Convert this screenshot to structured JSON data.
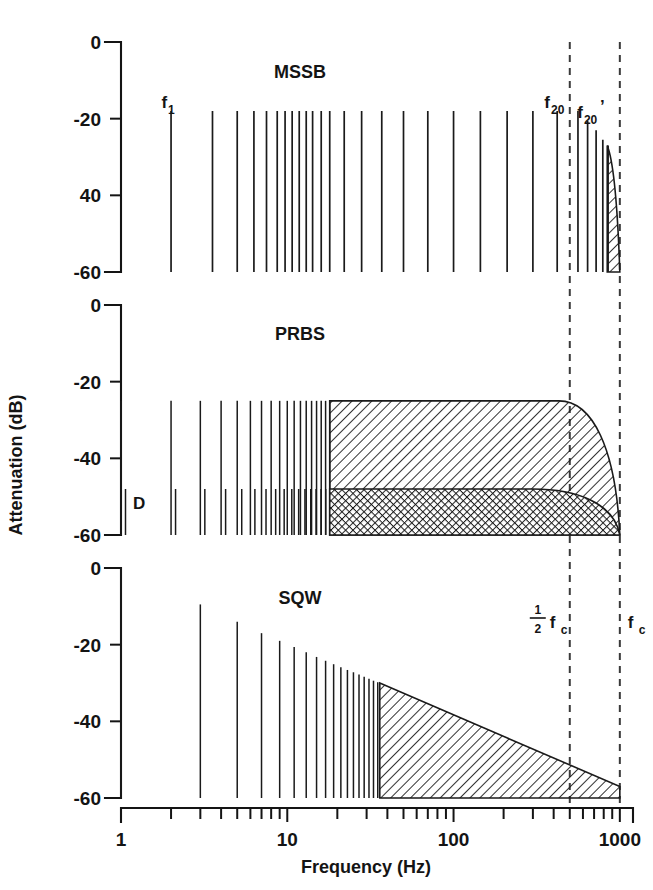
{
  "figure": {
    "axis_titles": {
      "x": "Frequency (Hz)",
      "y": "Attenuation (dB)"
    },
    "x_axis": {
      "scale": "log",
      "min": 1,
      "max": 1200,
      "tick_labels": [
        "1",
        "10",
        "100",
        "1000"
      ],
      "tick_values": [
        1,
        10,
        100,
        1000
      ]
    },
    "y_axis": {
      "min": -60,
      "max": 0,
      "tick_values": [
        0,
        -20,
        -40,
        -60
      ],
      "panel_tick_labels": {
        "mssb": [
          "0",
          "-20",
          "40",
          "-60"
        ],
        "prbs": [
          "0",
          "-20",
          "-40",
          "-60"
        ],
        "sqw": [
          "0",
          "-20",
          "-40",
          "-60"
        ]
      }
    },
    "annotations": {
      "f1": "f",
      "f1_sub": "1",
      "f20": "f",
      "f20_sub": "20",
      "f20p": "f",
      "f20p_sub": "20",
      "f20p_prime": "’",
      "half_fc_num": "1",
      "half_fc_den": "2",
      "half_fc_f": "f",
      "half_fc_sub": "c",
      "fc_f": "f",
      "fc_sub": "c",
      "prbs_D": "D"
    },
    "markers": {
      "half_fc_value": 500,
      "fc_value": 1000
    }
  },
  "chart_data": [
    {
      "type": "line",
      "title": "MSSB",
      "panel": "mssb",
      "xlabel": "Frequency (Hz)",
      "ylabel": "Attenuation (dB)",
      "xscale": "log",
      "xlim": [
        1,
        1200
      ],
      "ylim": [
        -60,
        0
      ],
      "grid": false,
      "legend": "none",
      "description": "Multi-sine stepped binary spectral lines: 20 harmonics at -18 dB plus aliased images above fc/2 and a hatched alias wedge near fc",
      "stems": {
        "x": [
          2.0,
          3.55,
          5.0,
          6.3,
          7.5,
          8.7,
          9.7,
          10.7,
          11.8,
          13.0,
          14.2,
          16.0,
          18.0,
          22.0,
          28.0,
          37.0,
          50.0,
          70.0,
          100.0,
          145.0,
          210.0,
          300.0,
          420.0
        ],
        "y_top": -18,
        "y_bottom": -60
      },
      "alias_stems": {
        "x": [
          560.0,
          640.0,
          720.0,
          790.0,
          850.0
        ],
        "y_top": [
          -18,
          -20.5,
          -23,
          -25.5,
          -27
        ],
        "y_bottom": -60
      },
      "alias_wedge": {
        "x_start": 840,
        "x_end": 1000,
        "y_top_start": -27,
        "y_top_end": -60,
        "y_bottom": -60,
        "fill": "diagonal-hatch"
      }
    },
    {
      "type": "line",
      "title": "PRBS",
      "panel": "prbs",
      "xlabel": "Frequency (Hz)",
      "ylabel": "Attenuation (dB)",
      "xscale": "log",
      "xlim": [
        1,
        1200
      ],
      "ylim": [
        -60,
        0
      ],
      "grid": false,
      "legend": "none",
      "description": "Pseudo random binary sequence: harmonic comb at -25 dB with a lower distortion comb D at -48 dB; both merge into continuous bands that roll off beyond fc/2",
      "stems_primary": {
        "x": [
          1.0,
          2.0,
          3.0,
          4.0,
          5.0,
          6.0,
          7.0,
          8.0,
          9.0,
          10.0,
          11.0,
          12.0,
          13.0,
          14.0,
          15.0,
          16.0,
          17.0,
          18.0
        ],
        "y_top": -25,
        "y_bottom": -60
      },
      "stems_distortion": {
        "x": [
          1.0,
          2.0,
          3.0,
          4.0,
          5.0,
          6.0,
          7.0,
          8.0,
          9.0,
          10.0,
          11.0,
          12.0,
          13.0,
          14.0,
          15.0,
          16.0,
          17.0,
          18.0
        ],
        "y_top": -48,
        "y_bottom": -60,
        "label": "D"
      },
      "band_primary": {
        "x_start": 18,
        "y_level": -25,
        "rolloff_start": 430,
        "x_end": 1000,
        "fill": "diagonal-hatch"
      },
      "band_distortion": {
        "x_start": 18,
        "y_level": -48,
        "rolloff_start": 300,
        "x_end": 1000,
        "fill": "cross-hatch"
      }
    },
    {
      "type": "line",
      "title": "SQW",
      "panel": "sqw",
      "xlabel": "Frequency (Hz)",
      "ylabel": "Attenuation (dB)",
      "xscale": "log",
      "xlim": [
        1,
        1200
      ],
      "ylim": [
        -60,
        0
      ],
      "grid": false,
      "legend": "none",
      "description": "Square wave odd harmonics falling as 1/n from 0 dB, merging into a linearly decaying hatched envelope reaching about -57 dB at fc",
      "stems": {
        "x": [
          1.0,
          3.0,
          5.0,
          7.0,
          9.0,
          11.0,
          13.0,
          15.0,
          17.0,
          19.0,
          21.0,
          23.0,
          25.0,
          27.0,
          29.0,
          31.0,
          33.0,
          35.0
        ],
        "y_top": [
          0,
          -9.5,
          -14.0,
          -17.0,
          -19.0,
          -20.6,
          -22.0,
          -23.2,
          -24.2,
          -25.1,
          -25.9,
          -26.6,
          -27.2,
          -27.8,
          -28.4,
          -28.9,
          -29.4,
          -29.8
        ],
        "y_bottom": -60
      },
      "envelope": {
        "x_start": 36,
        "x_end": 1000,
        "y_start": -30,
        "y_end": -57,
        "y_bottom": -60,
        "fill": "diagonal-hatch"
      }
    }
  ]
}
